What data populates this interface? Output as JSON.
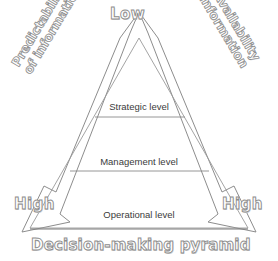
{
  "diagram": {
    "title": "Decision-making pyramid",
    "apex_label": "Low",
    "left_corner_label": "High",
    "right_corner_label": "High",
    "left_axis_label_line1": "Predictability",
    "left_axis_label_line2": "of information",
    "right_axis_label_line1": "Availability",
    "right_axis_label_line2": "of information",
    "levels": [
      {
        "name": "Strategic level"
      },
      {
        "name": "Management level"
      },
      {
        "name": "Operational level"
      }
    ],
    "colors": {
      "outline": "#8d8d8d",
      "text_fill": "#ffffff",
      "shadow": "#d2d2d2",
      "line": "#707070",
      "level_text": "#3b3b3b",
      "background": "#ffffff"
    }
  }
}
